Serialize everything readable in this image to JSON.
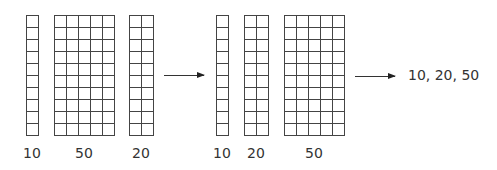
{
  "before": {
    "blocks": [
      {
        "value": "10",
        "columns": 1,
        "rows": 10
      },
      {
        "value": "50",
        "columns": 5,
        "rows": 10
      },
      {
        "value": "20",
        "columns": 2,
        "rows": 10
      }
    ]
  },
  "after": {
    "blocks": [
      {
        "value": "10",
        "columns": 1,
        "rows": 10
      },
      {
        "value": "20",
        "columns": 2,
        "rows": 10
      },
      {
        "value": "50",
        "columns": 5,
        "rows": 10
      }
    ]
  },
  "result": {
    "text": "10, 20, 50"
  },
  "colors": {
    "grid_line": "#444444",
    "text": "#333333"
  }
}
